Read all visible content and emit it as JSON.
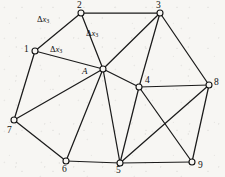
{
  "figure": {
    "type": "mesh-diagram",
    "background_color": "#f7f6f3",
    "line_color": "#1b1b1b",
    "node_fill_color": "#f7f6f3",
    "width": 225,
    "height": 177
  },
  "nodes": [
    {
      "id": "1",
      "label": "1",
      "x": 35,
      "y": 51,
      "label_x": 24,
      "label_y": 45,
      "marker_r": 3.0
    },
    {
      "id": "2",
      "label": "2",
      "x": 81,
      "y": 13,
      "label_x": 77,
      "label_y": 1,
      "marker_r": 3.0
    },
    {
      "id": "3",
      "label": "3",
      "x": 160,
      "y": 13,
      "label_x": 156,
      "label_y": 1,
      "marker_r": 3.0
    },
    {
      "id": "4",
      "label": "4",
      "x": 139,
      "y": 87,
      "label_x": 145,
      "label_y": 76,
      "marker_r": 3.0
    },
    {
      "id": "5",
      "label": "5",
      "x": 120,
      "y": 163,
      "label_x": 116,
      "label_y": 166,
      "marker_r": 3.0
    },
    {
      "id": "6",
      "label": "6",
      "x": 66,
      "y": 161,
      "label_x": 62,
      "label_y": 165,
      "marker_r": 3.0
    },
    {
      "id": "7",
      "label": "7",
      "x": 14,
      "y": 120,
      "label_x": 7,
      "label_y": 126,
      "marker_r": 3.0
    },
    {
      "id": "8",
      "label": "8",
      "x": 209,
      "y": 85,
      "label_x": 214,
      "label_y": 78,
      "marker_r": 3.0
    },
    {
      "id": "9",
      "label": "9",
      "x": 192,
      "y": 162,
      "label_x": 198,
      "label_y": 161,
      "marker_r": 3.0
    },
    {
      "id": "A",
      "label": "A",
      "x": 103,
      "y": 69,
      "label_x": 82,
      "label_y": 67,
      "marker_r": 3.0
    }
  ],
  "edges": [
    {
      "from": "1",
      "to": "2"
    },
    {
      "from": "1",
      "to": "A"
    },
    {
      "from": "1",
      "to": "7"
    },
    {
      "from": "2",
      "to": "3"
    },
    {
      "from": "2",
      "to": "A"
    },
    {
      "from": "3",
      "to": "A"
    },
    {
      "from": "3",
      "to": "4"
    },
    {
      "from": "3",
      "to": "8"
    },
    {
      "from": "4",
      "to": "A"
    },
    {
      "from": "4",
      "to": "5"
    },
    {
      "from": "4",
      "to": "8"
    },
    {
      "from": "4",
      "to": "9"
    },
    {
      "from": "5",
      "to": "A"
    },
    {
      "from": "5",
      "to": "6"
    },
    {
      "from": "5",
      "to": "8"
    },
    {
      "from": "5",
      "to": "9"
    },
    {
      "from": "6",
      "to": "A"
    },
    {
      "from": "6",
      "to": "7"
    },
    {
      "from": "7",
      "to": "A"
    },
    {
      "from": "8",
      "to": "9"
    }
  ],
  "annotations": [
    {
      "id": "ann-1-2",
      "delta": "Δ",
      "variable": "x",
      "subscript": "3",
      "x": 37,
      "y": 15,
      "edge": "1-2"
    },
    {
      "id": "ann-2-A",
      "delta": "Δ",
      "variable": "x",
      "subscript": "3",
      "x": 86,
      "y": 29,
      "edge": "2-A"
    },
    {
      "id": "ann-1-A",
      "delta": "Δ",
      "variable": "x",
      "subscript": "3",
      "x": 50,
      "y": 45,
      "edge": "1-A"
    }
  ]
}
